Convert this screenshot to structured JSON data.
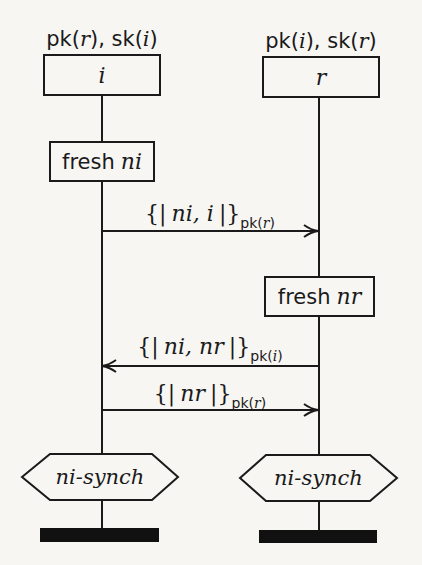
{
  "diagram": {
    "type": "message-sequence-chart",
    "roles": [
      {
        "id": "i",
        "name": "i",
        "knowledge": {
          "pk_arg": "r",
          "sk_arg": "i",
          "pk_label": "pk",
          "sk_label": "sk",
          "separator": ","
        },
        "lifeline_x": 102
      },
      {
        "id": "r",
        "name": "r",
        "knowledge": {
          "pk_arg": "i",
          "sk_arg": "r",
          "pk_label": "pk",
          "sk_label": "sk",
          "separator": ","
        },
        "lifeline_x": 319
      }
    ],
    "events": [
      {
        "type": "fresh",
        "role": "i",
        "keyword": "fresh",
        "var": "ni"
      },
      {
        "type": "send",
        "from": "i",
        "to": "r",
        "open": "{|",
        "content": "ni, i",
        "close": "|}",
        "key_fn": "pk",
        "key_arg": "r"
      },
      {
        "type": "fresh",
        "role": "r",
        "keyword": "fresh",
        "var": "nr"
      },
      {
        "type": "send",
        "from": "r",
        "to": "i",
        "open": "{|",
        "content": "ni, nr",
        "close": "|}",
        "key_fn": "pk",
        "key_arg": "i"
      },
      {
        "type": "send",
        "from": "i",
        "to": "r",
        "open": "{|",
        "content": "nr",
        "close": "|}",
        "key_fn": "pk",
        "key_arg": "r"
      }
    ],
    "claims": [
      {
        "role": "i",
        "label": "ni-synch"
      },
      {
        "role": "r",
        "label": "ni-synch"
      }
    ],
    "colors": {
      "ink": "#1a1a1a",
      "background": "#f7f6f3",
      "end_bar": "#111111"
    }
  }
}
